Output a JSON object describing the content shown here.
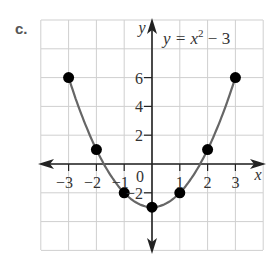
{
  "problem_label": "c.",
  "chart_data": {
    "type": "line",
    "equation": {
      "base": "y = x",
      "exp": "2",
      "tail": " − 3"
    },
    "xlabel": "x",
    "ylabel": "y",
    "xlim": [
      -4,
      4
    ],
    "ylim": [
      -6,
      10
    ],
    "grid": true,
    "x_ticks": [
      "−3",
      "−2",
      "−1",
      "1",
      "2",
      "3"
    ],
    "y_ticks": [
      "6",
      "4",
      "2",
      "−2"
    ],
    "origin_label": "0",
    "points": [
      {
        "x": -3,
        "y": 6
      },
      {
        "x": -2,
        "y": 1
      },
      {
        "x": -1,
        "y": -2
      },
      {
        "x": 0,
        "y": -3
      },
      {
        "x": 1,
        "y": -2
      },
      {
        "x": 2,
        "y": 1
      },
      {
        "x": 3,
        "y": 6
      }
    ],
    "colors": {
      "curve": "#666666",
      "points": "#000000",
      "grid": "#cccccc",
      "axes": "#222222"
    }
  }
}
